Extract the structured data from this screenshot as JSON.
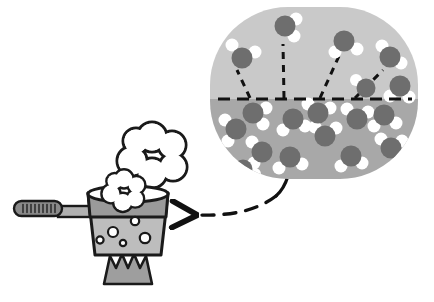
{
  "figure": {
    "caption": "",
    "width": 434,
    "height": 302,
    "background": "#ffffff"
  },
  "palette": {
    "outline": "#1a1a1a",
    "bubble_vapor_fill": "#c9c9c9",
    "bubble_liquid_fill": "#a8a8a8",
    "oxygen_atom": "#6e6e6e",
    "hydrogen_atom": "#ffffff",
    "pot_rim": "#9a9a9a",
    "pot_body": "#bdbdbd",
    "pot_bubble": "#ffffff",
    "handle_grip": "#8a8a8a",
    "handle_neck": "#b0b0b0",
    "flame": "#9e9e9e",
    "steam": "#ffffff",
    "dash": "#111111"
  },
  "callout_bubble": {
    "label": "magnified-view-of-water",
    "shape": "rounded-oval",
    "cx": 314,
    "cy": 93,
    "rx": 104,
    "ry": 86,
    "corner_radius": 78,
    "surface_line_y": 99,
    "regions": [
      {
        "name": "vapor-region",
        "label": "above-liquid-surface",
        "fill": "#c9c9c9"
      },
      {
        "name": "liquid-region",
        "label": "below-liquid-surface",
        "fill": "#a8a8a8"
      }
    ],
    "tail": {
      "from_x": 288,
      "from_y": 176,
      "to_x": 276,
      "to_y": 196
    }
  },
  "surface_line": {
    "name": "liquid-surface-dashed-line",
    "x1": 218,
    "y1": 99,
    "x2": 412,
    "y2": 99,
    "dash": "12 7",
    "width": 3.2
  },
  "vapor_molecules": [
    {
      "id": "v1",
      "ox": 242,
      "oy": 58,
      "or": 10.5,
      "h": [
        {
          "x": 232,
          "y": 45,
          "r": 6.5
        },
        {
          "x": 255,
          "y": 52,
          "r": 6.5
        }
      ]
    },
    {
      "id": "v2",
      "ox": 285,
      "oy": 26,
      "or": 10.5,
      "h": [
        {
          "x": 296,
          "y": 19,
          "r": 6.5
        },
        {
          "x": 294,
          "y": 36,
          "r": 6.5
        }
      ]
    },
    {
      "id": "v3",
      "ox": 344,
      "oy": 41,
      "or": 10.5,
      "h": [
        {
          "x": 335,
          "y": 52,
          "r": 6.5
        },
        {
          "x": 357,
          "y": 49,
          "r": 6.5
        }
      ]
    },
    {
      "id": "v4",
      "ox": 390,
      "oy": 57,
      "or": 10.5,
      "h": [
        {
          "x": 382,
          "y": 46,
          "r": 6.5
        },
        {
          "x": 401,
          "y": 63,
          "r": 6.5
        }
      ]
    }
  ],
  "escape_trajectories": [
    {
      "id": "t1",
      "x1": 250,
      "y1": 98,
      "x2": 237,
      "y2": 70,
      "dash": "7 6"
    },
    {
      "id": "t2",
      "x1": 284,
      "y1": 98,
      "x2": 283,
      "y2": 44,
      "dash": "7 6"
    },
    {
      "id": "t3",
      "x1": 320,
      "y1": 98,
      "x2": 339,
      "y2": 56,
      "dash": "7 6"
    },
    {
      "id": "t4",
      "x1": 355,
      "y1": 98,
      "x2": 383,
      "y2": 70,
      "dash": "7 6"
    }
  ],
  "liquid_molecules": [
    {
      "id": "l1",
      "ox": 236,
      "oy": 129,
      "or": 10.5,
      "h": [
        {
          "x": 225,
          "y": 120,
          "r": 6.5
        },
        {
          "x": 228,
          "y": 141,
          "r": 6.5
        }
      ]
    },
    {
      "id": "l2",
      "ox": 253,
      "oy": 113,
      "or": 10.5,
      "h": [
        {
          "x": 266,
          "y": 108,
          "r": 6.5
        },
        {
          "x": 263,
          "y": 124,
          "r": 6.5
        }
      ]
    },
    {
      "id": "l3",
      "ox": 262,
      "oy": 152,
      "or": 10.5,
      "h": [
        {
          "x": 252,
          "y": 142,
          "r": 6.5
        },
        {
          "x": 254,
          "y": 163,
          "r": 6.5
        }
      ]
    },
    {
      "id": "l4",
      "ox": 293,
      "oy": 119,
      "or": 10.5,
      "h": [
        {
          "x": 283,
          "y": 130,
          "r": 6.5
        },
        {
          "x": 305,
          "y": 126,
          "r": 6.5
        }
      ]
    },
    {
      "id": "l5",
      "ox": 290,
      "oy": 157,
      "or": 10.5,
      "h": [
        {
          "x": 279,
          "y": 168,
          "r": 6.5
        },
        {
          "x": 302,
          "y": 164,
          "r": 6.5
        }
      ]
    },
    {
      "id": "l6",
      "ox": 325,
      "oy": 136,
      "or": 10.5,
      "h": [
        {
          "x": 315,
          "y": 127,
          "r": 6.5
        },
        {
          "x": 336,
          "y": 128,
          "r": 6.5
        }
      ]
    },
    {
      "id": "l7",
      "ox": 318,
      "oy": 113,
      "or": 10.5,
      "h": [
        {
          "x": 330,
          "y": 108,
          "r": 6.5
        },
        {
          "x": 308,
          "y": 104,
          "r": 6.5
        }
      ]
    },
    {
      "id": "l8",
      "ox": 351,
      "oy": 156,
      "or": 10.5,
      "h": [
        {
          "x": 341,
          "y": 166,
          "r": 6.5
        },
        {
          "x": 362,
          "y": 163,
          "r": 6.5
        }
      ]
    },
    {
      "id": "l9",
      "ox": 357,
      "oy": 119,
      "or": 10.5,
      "h": [
        {
          "x": 368,
          "y": 112,
          "r": 6.5
        },
        {
          "x": 347,
          "y": 109,
          "r": 6.5
        }
      ]
    },
    {
      "id": "l10",
      "ox": 384,
      "oy": 115,
      "or": 10.5,
      "h": [
        {
          "x": 374,
          "y": 126,
          "r": 6.5
        },
        {
          "x": 396,
          "y": 123,
          "r": 6.5
        }
      ]
    },
    {
      "id": "l11",
      "ox": 391,
      "oy": 148,
      "or": 10.5,
      "h": [
        {
          "x": 381,
          "y": 139,
          "r": 6.5
        },
        {
          "x": 402,
          "y": 141,
          "r": 6.5
        }
      ]
    },
    {
      "id": "l12",
      "ox": 400,
      "oy": 86,
      "or": 10.5,
      "h": [
        {
          "x": 390,
          "y": 96,
          "r": 6.5
        },
        {
          "x": 409,
          "y": 97,
          "r": 6.5
        }
      ]
    },
    {
      "id": "l13",
      "ox": 243,
      "oy": 169,
      "or": 9.5,
      "h": [
        {
          "x": 255,
          "y": 174,
          "r": 6.0
        }
      ]
    },
    {
      "id": "l14",
      "ox": 366,
      "oy": 88,
      "or": 9.5,
      "h": [
        {
          "x": 356,
          "y": 80,
          "r": 6.0
        }
      ]
    }
  ],
  "connector_arrow": {
    "name": "magnification-arrow",
    "description": "dashed curved arrow from magnified bubble to pot",
    "path": "M 276,196 C 255,212 228,216 196,215",
    "dash": "12 10",
    "width": 3.4,
    "head": {
      "tip_x": 178,
      "tip_y": 214,
      "size": 13
    }
  },
  "pot": {
    "name": "cooking-pot",
    "body": {
      "x": 88,
      "y": 193,
      "w": 80,
      "h": 62
    },
    "rim_band": {
      "x": 88,
      "y": 193,
      "w": 80,
      "h": 24
    },
    "rim_ellipse": {
      "cx": 128,
      "cy": 194,
      "rx": 40,
      "ry": 8
    },
    "bubbles": [
      {
        "cx": 113,
        "cy": 232,
        "r": 5.0
      },
      {
        "cx": 100,
        "cy": 240,
        "r": 3.6
      },
      {
        "cx": 123,
        "cy": 243,
        "r": 3.2
      },
      {
        "cx": 145,
        "cy": 238,
        "r": 5.2
      },
      {
        "cx": 135,
        "cy": 221,
        "r": 4.2
      }
    ],
    "handle": {
      "neck": {
        "x": 58,
        "y": 206,
        "w": 34,
        "h": 11
      },
      "grip": {
        "x": 14,
        "y": 201,
        "w": 48,
        "h": 15,
        "radius": 7.5
      },
      "grip_ridges": 9
    },
    "flame": {
      "name": "gas-flame",
      "points": "110,256 116,268 122,254 128,268 134,254 140,268 146,256 152,284 104,284",
      "fill": "#9e9e9e"
    }
  },
  "steam": [
    {
      "id": "steam-large",
      "cx": 152,
      "cy": 155,
      "scale": 1.0,
      "lobes": [
        {
          "cx": 0,
          "cy": -18,
          "r": 15
        },
        {
          "cx": 20,
          "cy": -10,
          "r": 14
        },
        {
          "cx": 21,
          "cy": 12,
          "r": 14
        },
        {
          "cx": 0,
          "cy": 18,
          "r": 15
        },
        {
          "cx": -20,
          "cy": 6,
          "r": 15
        },
        {
          "cx": -16,
          "cy": -14,
          "r": 13
        }
      ]
    },
    {
      "id": "steam-small",
      "cx": 124,
      "cy": 190,
      "scale": 0.62,
      "lobes": [
        {
          "cx": 0,
          "cy": -18,
          "r": 15
        },
        {
          "cx": 20,
          "cy": -8,
          "r": 14
        },
        {
          "cx": 18,
          "cy": 14,
          "r": 14
        },
        {
          "cx": -2,
          "cy": 20,
          "r": 15
        },
        {
          "cx": -21,
          "cy": 6,
          "r": 15
        },
        {
          "cx": -15,
          "cy": -14,
          "r": 13
        }
      ]
    }
  ]
}
